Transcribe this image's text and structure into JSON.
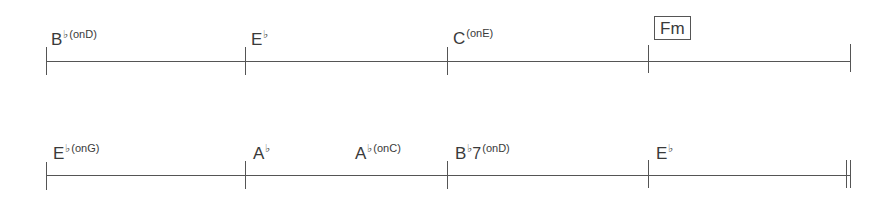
{
  "chart": {
    "lines": [
      {
        "measures": [
          {
            "chords": [
              {
                "root": "B",
                "accidental": "♭",
                "quality": "",
                "bass": "(onD)",
                "x": 51
              }
            ]
          },
          {
            "chords": [
              {
                "root": "E",
                "accidental": "♭",
                "quality": "",
                "bass": "",
                "x": 251
              }
            ]
          },
          {
            "chords": [
              {
                "root": "C",
                "accidental": "",
                "quality": "",
                "bass": "(onE)",
                "x": 453
              }
            ]
          },
          {
            "chords": [
              {
                "root": "F",
                "accidental": "",
                "quality": "m",
                "bass": "",
                "x": 654,
                "boxed": true
              }
            ]
          }
        ],
        "end_barline": "single"
      },
      {
        "measures": [
          {
            "chords": [
              {
                "root": "E",
                "accidental": "♭",
                "quality": "",
                "bass": "(onG)",
                "x": 53
              }
            ]
          },
          {
            "chords": [
              {
                "root": "A",
                "accidental": "♭",
                "quality": "",
                "bass": "",
                "x": 253
              },
              {
                "root": "A",
                "accidental": "♭",
                "quality": "",
                "bass": "(onC)",
                "x": 355
              }
            ]
          },
          {
            "chords": [
              {
                "root": "B",
                "accidental": "♭",
                "quality": "7",
                "bass": "(onD)",
                "x": 455
              }
            ]
          },
          {
            "chords": [
              {
                "root": "E",
                "accidental": "♭",
                "quality": "",
                "bass": "",
                "x": 656
              }
            ]
          }
        ],
        "end_barline": "double"
      }
    ]
  },
  "labels": {
    "l1m1_root": "B",
    "l1m1_acc": "♭",
    "l1m1_bass": "(onD)",
    "l1m2_root": "E",
    "l1m2_acc": "♭",
    "l1m3_root": "C",
    "l1m3_bass": "(onE)",
    "l1m4_root": "F",
    "l1m4_qual": "m",
    "l2m1_root": "E",
    "l2m1_acc": "♭",
    "l2m1_bass": "(onG)",
    "l2m2a_root": "A",
    "l2m2a_acc": "♭",
    "l2m2b_root": "A",
    "l2m2b_acc": "♭",
    "l2m2b_bass": "(onC)",
    "l2m3_root": "B",
    "l2m3_acc": "♭",
    "l2m3_qual": "7",
    "l2m3_bass": "(onD)",
    "l2m4_root": "E",
    "l2m4_acc": "♭"
  }
}
